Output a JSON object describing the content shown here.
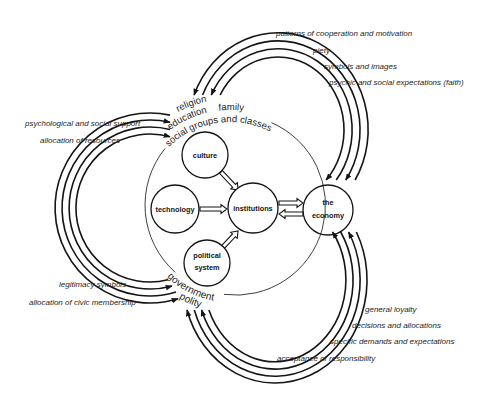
{
  "diagram": {
    "nodes": {
      "culture": "culture",
      "technology": "technology",
      "institutions": "institutions",
      "political_system": [
        "political",
        "system"
      ],
      "economy": [
        "the",
        "economy"
      ]
    },
    "society_labels": {
      "religion": "religion",
      "education": "education",
      "family": "family",
      "social_groups": "social groups and classes"
    },
    "government_labels": {
      "government": "government",
      "polity": "polity"
    },
    "flows": {
      "religion_economy": [
        "patterns of cooperation and motivation",
        "piety",
        "symbols and images",
        "psychic and social expectations (faith)"
      ],
      "government_religion": [
        "psychological and social support",
        "allocation of resources",
        "legitimacy symbols",
        "allocation of civic membership"
      ],
      "economy_government": [
        "general loyalty",
        "decisions and allocations",
        "specific demands and expectations",
        "acceptance of responsibility"
      ]
    },
    "colors": {
      "ink": "#151515",
      "background": "#ffffff"
    }
  }
}
